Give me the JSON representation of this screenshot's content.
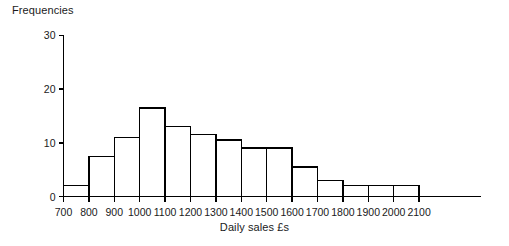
{
  "chart_data": {
    "type": "bar",
    "title": "",
    "ylabel": "Frequencies",
    "xlabel": "Daily sales £s",
    "bin_edges": [
      700,
      800,
      900,
      1000,
      1100,
      1200,
      1300,
      1400,
      1500,
      1600,
      1700,
      1800,
      1900,
      2000,
      2100
    ],
    "categories": [
      "700-800",
      "800-900",
      "900-1000",
      "1000-1100",
      "1100-1200",
      "1200-1300",
      "1300-1400",
      "1400-1500",
      "1500-1600",
      "1600-1700",
      "1700-1800",
      "1800-1900",
      "1900-2000",
      "2000-2100"
    ],
    "values": [
      2,
      7.5,
      11,
      16.5,
      13,
      11.5,
      10.5,
      9,
      9,
      5.5,
      3,
      2,
      2,
      2
    ],
    "xlim": [
      700,
      2100
    ],
    "ylim": [
      0,
      30
    ],
    "y_ticks": [
      0,
      10,
      20,
      30
    ],
    "x_ticks": [
      700,
      800,
      900,
      1000,
      1100,
      1200,
      1300,
      1400,
      1500,
      1600,
      1700,
      1800,
      1900,
      2000,
      2100
    ],
    "grid": false,
    "legend": null,
    "bar_fill": "#ffffff",
    "bar_stroke": "#000000",
    "axis_color": "#000000"
  },
  "axes": {
    "y_title": "Frequencies",
    "x_title": "Daily sales £s",
    "y_tick_labels": [
      "0",
      "10",
      "20",
      "30"
    ],
    "x_tick_labels": [
      "700",
      "800",
      "900",
      "1000",
      "1100",
      "1200",
      "1300",
      "1400",
      "1500",
      "1600",
      "1700",
      "1800",
      "1900",
      "2000",
      "2100"
    ]
  }
}
